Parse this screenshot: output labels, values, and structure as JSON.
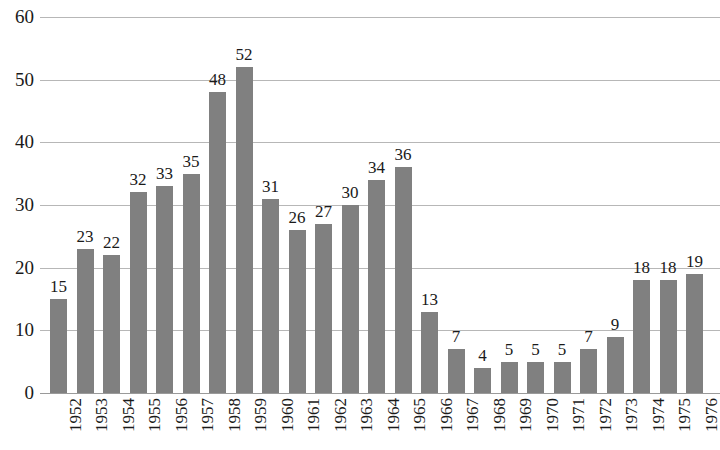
{
  "chart_data": {
    "type": "bar",
    "title": "",
    "subtitle": "",
    "xlabel": "",
    "ylabel": "",
    "categories": [
      "1952",
      "1953",
      "1954",
      "1955",
      "1956",
      "1957",
      "1958",
      "1959",
      "1960",
      "1961",
      "1962",
      "1963",
      "1964",
      "1965",
      "1966",
      "1967",
      "1968",
      "1969",
      "1970",
      "1971",
      "1972",
      "1973",
      "1974",
      "1975",
      "1976"
    ],
    "values": [
      15,
      23,
      22,
      32,
      33,
      35,
      48,
      52,
      31,
      26,
      27,
      30,
      34,
      36,
      13,
      7,
      4,
      5,
      5,
      5,
      7,
      9,
      18,
      18,
      19
    ],
    "data_labels": [
      "15",
      "23",
      "22",
      "32",
      "33",
      "35",
      "48",
      "52",
      "31",
      "26",
      "27",
      "30",
      "34",
      "36",
      "13",
      "7",
      "4",
      "5",
      "5",
      "5",
      "7",
      "9",
      "18",
      "18",
      "19"
    ],
    "ylim": [
      0,
      60
    ],
    "yticks": [
      "0",
      "10",
      "20",
      "30",
      "40",
      "50",
      "60"
    ],
    "ytick_values": [
      0,
      10,
      20,
      30,
      40,
      50,
      60
    ],
    "grid": true,
    "grid_axis": "y",
    "legend": null,
    "legend_position": "none",
    "bar_color": "#808080",
    "grid_color": "#b7b7b7",
    "axis_color": "#9a9a9a",
    "text_color": "#1a1a1a",
    "xtick_rotation": 90,
    "series": [
      {
        "name": "",
        "values": [
          15,
          23,
          22,
          32,
          33,
          35,
          48,
          52,
          31,
          26,
          27,
          30,
          34,
          36,
          13,
          7,
          4,
          5,
          5,
          5,
          7,
          9,
          18,
          18,
          19
        ]
      }
    ]
  }
}
